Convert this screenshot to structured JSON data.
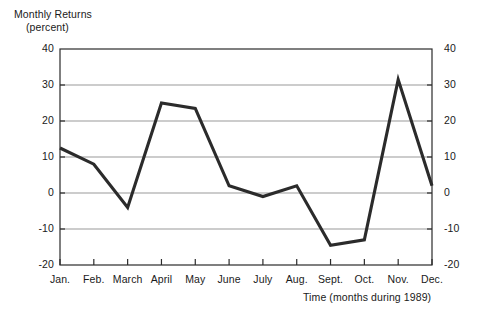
{
  "chart_data": {
    "type": "line",
    "title": "",
    "ylabel_line1": "Monthly Returns",
    "ylabel_line2": "(percent)",
    "xlabel": "Time (months during 1989)",
    "categories": [
      "Jan.",
      "Feb.",
      "March",
      "April",
      "May",
      "June",
      "July",
      "Aug.",
      "Sept.",
      "Oct.",
      "Nov.",
      "Dec."
    ],
    "values": [
      12.5,
      8,
      -4,
      25,
      23.5,
      2,
      -1,
      2,
      -14.5,
      -13,
      31.5,
      2
    ],
    "ylim": [
      -20,
      40
    ],
    "yticks": [
      40,
      30,
      20,
      10,
      0,
      -10,
      -20
    ],
    "ytick_labels_left": [
      "40",
      "30",
      "20",
      "10",
      "0",
      "-10",
      "-20"
    ],
    "ytick_labels_right": [
      "40",
      "30",
      "20",
      "10",
      "0",
      "-10",
      "-20"
    ],
    "grid": true,
    "legend": "none",
    "series_color": "#2b2b2b",
    "grid_color": "#9a9a9a",
    "axis_color": "#2b2b2b",
    "background_color": "#ffffff"
  }
}
